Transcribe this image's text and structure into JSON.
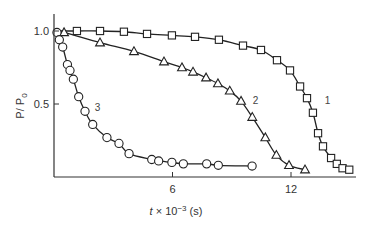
{
  "chart_data": {
    "type": "line",
    "title": "",
    "xlabel": "t × 10⁻³ (s)",
    "xlabel_parts": {
      "var": "t",
      "mult": " × 10",
      "exp": "−3",
      "unit": " (s)"
    },
    "ylabel": "P/ P0",
    "ylabel_parts": {
      "num": "P/ P",
      "sub": "0"
    },
    "xlim": [
      0,
      15.2
    ],
    "ylim": [
      0,
      1.0
    ],
    "x_ticks": [
      6,
      12
    ],
    "x_tick_labels": [
      "6",
      "12"
    ],
    "y_ticks": [
      0.5,
      1.0
    ],
    "y_tick_labels": [
      "0.5",
      "1.0"
    ],
    "grid": false,
    "legend": "none (curves labeled inline 1, 2, 3)",
    "series": [
      {
        "name": "1",
        "marker": "square",
        "label_pos": [
          13.85,
          0.5
        ],
        "x": [
          0,
          1.16,
          2.33,
          3.54,
          4.71,
          5.97,
          7.14,
          8.35,
          9.57,
          10.48,
          11.29,
          11.95,
          12.46,
          12.81,
          13.11,
          13.37,
          13.62,
          14.03,
          14.32,
          14.61,
          14.95
        ],
        "values": [
          1.0,
          1.0,
          1.0,
          0.995,
          0.98,
          0.97,
          0.96,
          0.94,
          0.9,
          0.87,
          0.8,
          0.73,
          0.62,
          0.54,
          0.44,
          0.3,
          0.21,
          0.13,
          0.09,
          0.06,
          0.05
        ],
        "marker_from": 1
      },
      {
        "name": "2",
        "marker": "triangle",
        "label_pos": [
          10.2,
          0.5
        ],
        "x": [
          0,
          0.51,
          2.33,
          4.05,
          5.57,
          6.48,
          7.04,
          7.7,
          8.3,
          8.9,
          9.47,
          10.04,
          10.7,
          11.26,
          11.9,
          12.71
        ],
        "values": [
          1.0,
          0.99,
          0.92,
          0.86,
          0.79,
          0.75,
          0.72,
          0.68,
          0.64,
          0.59,
          0.52,
          0.41,
          0.27,
          0.15,
          0.08,
          0.05
        ],
        "marker_from": 1
      },
      {
        "name": "3",
        "marker": "circle",
        "label_pos": [
          2.2,
          0.45
        ],
        "x": [
          0,
          0.15,
          0.27,
          0.44,
          0.68,
          0.81,
          0.98,
          1.25,
          1.57,
          1.96,
          2.68,
          3.29,
          3.8,
          4.95,
          5.3,
          5.97,
          6.55,
          7.73,
          8.32,
          10.03
        ],
        "values": [
          1.0,
          0.99,
          0.94,
          0.89,
          0.77,
          0.73,
          0.67,
          0.55,
          0.45,
          0.36,
          0.27,
          0.23,
          0.16,
          0.12,
          0.11,
          0.1,
          0.09,
          0.09,
          0.08,
          0.075
        ],
        "marker_from": 1
      }
    ]
  }
}
